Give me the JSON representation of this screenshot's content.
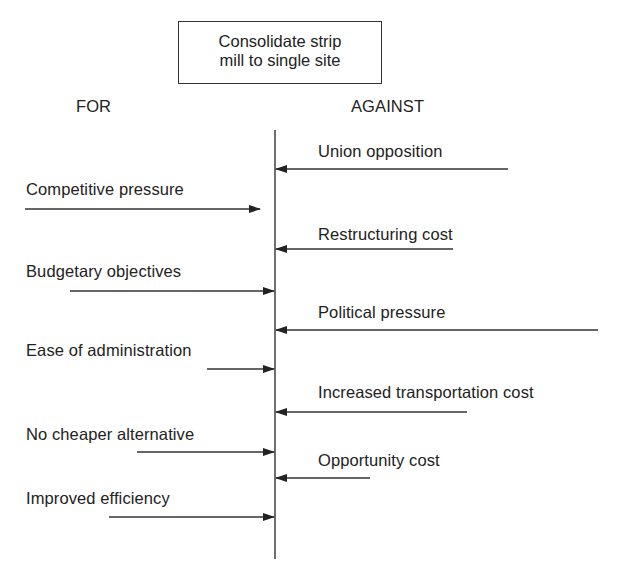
{
  "title": {
    "line1": "Consolidate strip",
    "line2": "mill to single site"
  },
  "headers": {
    "for": "FOR",
    "against": "AGAINST"
  },
  "for_forces": [
    {
      "label": "Competitive pressure",
      "text_y": 180,
      "arrow_y": 209,
      "arrow_x1": 25,
      "arrow_x2": 260
    },
    {
      "label": "Budgetary objectives",
      "text_y": 262,
      "arrow_y": 291,
      "arrow_x1": 70,
      "arrow_x2": 274
    },
    {
      "label": "Ease of administration",
      "text_y": 341,
      "arrow_y": 369,
      "arrow_x1": 207,
      "arrow_x2": 274
    },
    {
      "label": "No cheaper alternative",
      "text_y": 425,
      "arrow_y": 452,
      "arrow_x1": 137,
      "arrow_x2": 274
    },
    {
      "label": "Improved efficiency",
      "text_y": 489,
      "arrow_y": 517,
      "arrow_x1": 109,
      "arrow_x2": 274
    }
  ],
  "against_forces": [
    {
      "label": "Union opposition",
      "text_y": 142,
      "arrow_y": 169,
      "arrow_x1": 508,
      "arrow_x2": 276
    },
    {
      "label": "Restructuring cost",
      "text_y": 225,
      "arrow_y": 249,
      "arrow_x1": 453,
      "arrow_x2": 276
    },
    {
      "label": "Political pressure",
      "text_y": 303,
      "arrow_y": 330,
      "arrow_x1": 598,
      "arrow_x2": 276
    },
    {
      "label": "Increased transportation cost",
      "text_y": 383,
      "arrow_y": 412,
      "arrow_x1": 467,
      "arrow_x2": 276
    },
    {
      "label": "Opportunity cost",
      "text_y": 451,
      "arrow_y": 478,
      "arrow_x1": 370,
      "arrow_x2": 276
    }
  ],
  "center_line": {
    "x": 275,
    "y1": 130,
    "y2": 559
  },
  "colors": {
    "ink": "#222222",
    "background": "#ffffff"
  }
}
